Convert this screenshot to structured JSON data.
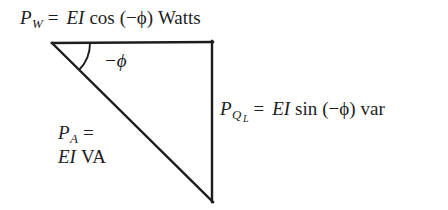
{
  "figure": {
    "name": "power-triangle-diagram",
    "background_color": "#ffffff",
    "line_color": "#1d1d1d",
    "text_color": "#1d1d1d"
  },
  "labels": {
    "real_power": {
      "symbol": "P",
      "subscript": "W",
      "equals": "=",
      "magnitude": "EI",
      "function": "cos",
      "argument": "(−ϕ)",
      "unit": "Watts",
      "full_text": "P_W = EI cos (−ϕ) Watts"
    },
    "reactive_power": {
      "symbol": "P",
      "subscript": "Q",
      "sub_subscript": "L",
      "equals": "=",
      "magnitude": "EI",
      "function": "sin",
      "argument": "(−ϕ)",
      "unit": "var",
      "full_text": "P_Q_L = EI sin (−ϕ) var"
    },
    "apparent_power": {
      "symbol": "P",
      "subscript": "A",
      "equals": "=",
      "magnitude": "EI",
      "unit": "VA",
      "line1": "P_A =",
      "line2": "EI VA"
    },
    "angle": {
      "text": "−ϕ"
    }
  },
  "geometry": {
    "top_left_vertex": [
      52,
      43
    ],
    "top_right_vertex": [
      212,
      42
    ],
    "bottom_right_vertex": [
      212,
      202
    ],
    "arc_radius": 38,
    "stroke_width": 2
  }
}
